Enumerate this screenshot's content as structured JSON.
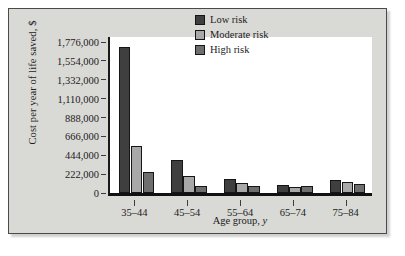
{
  "chart_data": {
    "type": "bar",
    "title": "",
    "subtitle": "",
    "xlabel": "Age group, y",
    "xlabel_plain": "Age group,",
    "xlabel_italic": "y",
    "ylabel": "Cost per year of life saved, $",
    "categories": [
      "35–44",
      "45–54",
      "55–64",
      "65–74",
      "75–84"
    ],
    "series": [
      {
        "name": "Low risk",
        "color": "#3f3f3f",
        "values": [
          1717000,
          390000,
          170000,
          95000,
          148000
        ]
      },
      {
        "name": "Moderate risk",
        "color": "#a8a8a8",
        "values": [
          553000,
          200000,
          118000,
          70000,
          132000
        ]
      },
      {
        "name": "High risk",
        "color": "#6e6e6e",
        "values": [
          247000,
          82000,
          85000,
          82000,
          108000
        ]
      }
    ],
    "ylim": [
      0,
      1776000
    ],
    "ytick_values": [
      0,
      222000,
      444000,
      666000,
      888000,
      1110000,
      1332000,
      1554000,
      1776000
    ],
    "ytick_labels": [
      "0",
      "222,000",
      "444,000",
      "666,000",
      "888,000",
      "1,110,000",
      "1,332,000",
      "1,554,000",
      "1,776,000"
    ],
    "grid": false,
    "legend_position": "top-right",
    "legend": [
      "Low risk",
      "Moderate risk",
      "High risk"
    ],
    "background_color": "#d9d9d6",
    "plot_background_color": "#ffffff",
    "axis_color": "#1a1a1a"
  }
}
